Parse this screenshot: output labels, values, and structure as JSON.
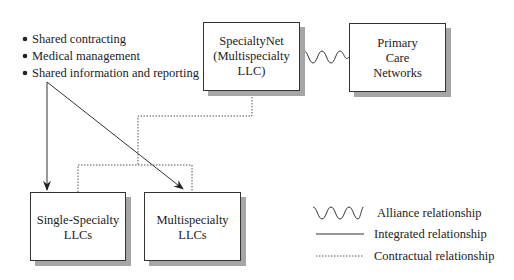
{
  "bullets": [
    "Shared contracting",
    "Medical management",
    "Shared information and reporting"
  ],
  "nodes": {
    "specialtynet": {
      "lines": [
        "SpecialtyNet",
        "(Multispecialty",
        "LLC)"
      ]
    },
    "primary_care": {
      "lines": [
        "Primary",
        "Care",
        "Networks"
      ]
    },
    "single_specialty": {
      "lines": [
        "Single-Specialty",
        "LLCs"
      ]
    },
    "multispecialty": {
      "lines": [
        "Multispecialty",
        "LLCs"
      ]
    }
  },
  "legend": {
    "alliance": "Alliance relationship",
    "integrated": "Integrated relationship",
    "contractual": "Contractual relationship"
  },
  "colors": {
    "stroke": "#333333",
    "shadow": "#a6a6a6",
    "background": "#ffffff"
  }
}
